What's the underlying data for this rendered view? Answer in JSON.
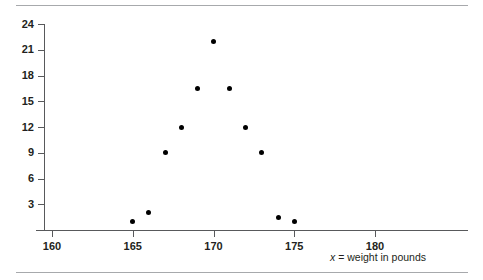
{
  "chart_data": {
    "type": "scatter",
    "title": "",
    "xlabel": "x = weight in pounds",
    "ylabel": "",
    "xlim": [
      158.5,
      184.5
    ],
    "ylim": [
      0,
      25
    ],
    "grid": false,
    "legend": false,
    "x_ticks": [
      160,
      165,
      170,
      175,
      180
    ],
    "y_ticks": [
      3,
      6,
      9,
      12,
      15,
      18,
      21,
      24
    ],
    "points": [
      {
        "x": 165,
        "y": 1
      },
      {
        "x": 166,
        "y": 2
      },
      {
        "x": 167,
        "y": 9
      },
      {
        "x": 168,
        "y": 12
      },
      {
        "x": 169,
        "y": 16.5
      },
      {
        "x": 170,
        "y": 22
      },
      {
        "x": 171,
        "y": 16.5
      },
      {
        "x": 172,
        "y": 12
      },
      {
        "x": 173,
        "y": 9
      },
      {
        "x": 174,
        "y": 1.5
      },
      {
        "x": 175,
        "y": 1
      }
    ]
  },
  "axis_title": {
    "variable": "x",
    "rest": " = weight in pounds"
  },
  "colors": {
    "rule": "#a7a9ac",
    "axis": "#58595b",
    "text": "#231f20",
    "dot": "#000000",
    "background": "#ffffff"
  }
}
